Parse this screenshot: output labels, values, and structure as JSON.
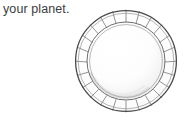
{
  "page": {
    "background_color": "#ffffff",
    "width": 190,
    "height": 125
  },
  "caption": {
    "text": "your planet.",
    "color": "#3b3b3b"
  },
  "illustration": {
    "name": "decorative-plate",
    "description": "Line-drawn round dish seen from above with a radially segmented rim",
    "center_x": 54,
    "center_y": 55,
    "outer_radius": 51,
    "inner_radius": 39,
    "well_radius": 36,
    "segment_count": 24,
    "colors": {
      "outer_stroke": "#4a4a4a",
      "inner_stroke": "#6e6e6e",
      "spoke_stroke": "#7a7a7a",
      "rim_fill": "#fdfdfd",
      "well_fill": "#fdfdfd",
      "shadow": "#d6d6d6",
      "highlight": "#ffffff"
    },
    "stroke_widths": {
      "outer": 1.3,
      "inner": 1.0,
      "spoke": 0.8
    }
  }
}
